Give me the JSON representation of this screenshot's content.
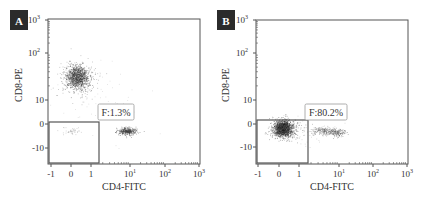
{
  "chart_data": [
    {
      "type": "scatter",
      "panel_label": "A",
      "xlabel": "CD4-FITC",
      "ylabel": "CD8-PE",
      "x_ticks": [
        "-1",
        "0",
        "1",
        "10¹",
        "10²",
        "10³"
      ],
      "y_ticks": [
        "10³",
        "10²",
        "10",
        "0",
        "-10"
      ],
      "gate": {
        "label": "F:1.3%",
        "percent": 1.3,
        "x_range": [
          "-1",
          "~1.5"
        ],
        "y_range": [
          "~-16",
          "~1.5"
        ]
      },
      "populations": [
        {
          "name": "CD8+ cluster",
          "approx_x": "0.3",
          "approx_y": "~30",
          "density": "high"
        },
        {
          "name": "CD4+ cluster",
          "approx_x": "~10",
          "approx_y": "~-3",
          "density": "medium"
        },
        {
          "name": "double-negative (gated)",
          "approx_x": "~0",
          "approx_y": "~-3",
          "density": "sparse"
        }
      ]
    },
    {
      "type": "scatter",
      "panel_label": "B",
      "xlabel": "CD4-FITC",
      "ylabel": "CD8-PE",
      "x_ticks": [
        "-1",
        "0",
        "1",
        "10¹",
        "10²",
        "10³"
      ],
      "y_ticks": [
        "10³",
        "10²",
        "10",
        "0",
        "-10"
      ],
      "gate": {
        "label": "F:80.2%",
        "percent": 80.2,
        "x_range": [
          "-1",
          "~1.5"
        ],
        "y_range": [
          "~-16",
          "~1.5"
        ]
      },
      "populations": [
        {
          "name": "double-negative (gated)",
          "approx_x": "~0.2",
          "approx_y": "~-2",
          "density": "very high"
        },
        {
          "name": "CD4 low tail",
          "approx_x": "~5",
          "approx_y": "~-3",
          "density": "low"
        }
      ]
    }
  ],
  "panels": [
    {
      "id": "A",
      "label": "A",
      "gate_label": "F:1.3%",
      "xlabel": "CD4-FITC",
      "ylabel": "CD8-PE",
      "frame": {
        "x0": 48,
        "y0": 19,
        "x1": 200,
        "y1": 164
      },
      "gate": {
        "x0": 49,
        "y0": 122,
        "x1": 99,
        "y1": 163
      },
      "gate_box": {
        "x": 98,
        "y": 104,
        "w": 36,
        "h": 16
      },
      "letter_box": {
        "x": 10,
        "y": 10,
        "w": 18,
        "h": 20
      },
      "x_ticks": [
        {
          "label": "-1",
          "x": 51,
          "sup": ""
        },
        {
          "label": "0",
          "x": 71,
          "sup": ""
        },
        {
          "label": "1",
          "x": 91,
          "sup": ""
        },
        {
          "label": "10",
          "x": 130,
          "sup": "1"
        },
        {
          "label": "10",
          "x": 165,
          "sup": "2"
        },
        {
          "label": "10",
          "x": 199,
          "sup": "3"
        }
      ],
      "y_ticks": [
        {
          "label": "10",
          "y": 20,
          "sup": "3"
        },
        {
          "label": "10",
          "y": 53,
          "sup": "2"
        },
        {
          "label": "10",
          "y": 100,
          "sup": ""
        },
        {
          "label": "0",
          "y": 124,
          "sup": ""
        },
        {
          "label": "-10",
          "y": 148,
          "sup": ""
        }
      ],
      "ylabel_pos": {
        "x": 22,
        "y": 85
      },
      "xlabel_pos": {
        "x": 124,
        "y": 190
      },
      "clusters": [
        {
          "cx": 77,
          "cy": 77,
          "rx": 9,
          "ry": 9,
          "n": 900,
          "color": "#333333",
          "seed": 11
        },
        {
          "cx": 77,
          "cy": 78,
          "rx": 16,
          "ry": 16,
          "n": 260,
          "color": "#777777",
          "seed": 12
        },
        {
          "cx": 127,
          "cy": 131,
          "rx": 8,
          "ry": 3,
          "n": 360,
          "color": "#444444",
          "seed": 13
        },
        {
          "cx": 71,
          "cy": 131,
          "rx": 8,
          "ry": 3,
          "n": 45,
          "color": "#999999",
          "seed": 14
        },
        {
          "cx": 90,
          "cy": 100,
          "rx": 40,
          "ry": 30,
          "n": 60,
          "color": "#bbbbbb",
          "seed": 15
        }
      ]
    },
    {
      "id": "B",
      "label": "B",
      "gate_label": "F:80.2%",
      "xlabel": "CD4-FITC",
      "ylabel": "CD8-PE",
      "frame": {
        "x0": 256,
        "y0": 20,
        "x1": 408,
        "y1": 164
      },
      "gate": {
        "x0": 257,
        "y0": 120,
        "x1": 308,
        "y1": 163
      },
      "gate_box": {
        "x": 305,
        "y": 104,
        "w": 42,
        "h": 16
      },
      "letter_box": {
        "x": 217,
        "y": 10,
        "w": 18,
        "h": 20
      },
      "x_ticks": [
        {
          "label": "-1",
          "x": 258,
          "sup": ""
        },
        {
          "label": "0",
          "x": 279,
          "sup": ""
        },
        {
          "label": "1",
          "x": 299,
          "sup": ""
        },
        {
          "label": "10",
          "x": 339,
          "sup": "1"
        },
        {
          "label": "10",
          "x": 373,
          "sup": "2"
        },
        {
          "label": "10",
          "x": 407,
          "sup": "3"
        }
      ],
      "y_ticks": [
        {
          "label": "10",
          "y": 20,
          "sup": "3"
        },
        {
          "label": "10",
          "y": 53,
          "sup": "2"
        },
        {
          "label": "10",
          "y": 100,
          "sup": ""
        },
        {
          "label": "0",
          "y": 124,
          "sup": ""
        },
        {
          "label": "-10",
          "y": 147,
          "sup": ""
        }
      ],
      "ylabel_pos": {
        "x": 229,
        "y": 85
      },
      "xlabel_pos": {
        "x": 332,
        "y": 190
      },
      "clusters": [
        {
          "cx": 283,
          "cy": 128,
          "rx": 7,
          "ry": 6,
          "n": 1300,
          "color": "#222222",
          "seed": 21
        },
        {
          "cx": 284,
          "cy": 129,
          "rx": 12,
          "ry": 9,
          "n": 380,
          "color": "#555555",
          "seed": 22
        },
        {
          "cx": 327,
          "cy": 131,
          "rx": 14,
          "ry": 3,
          "n": 260,
          "color": "#666666",
          "seed": 23
        },
        {
          "cx": 338,
          "cy": 133,
          "rx": 6,
          "ry": 3,
          "n": 90,
          "color": "#555555",
          "seed": 24
        },
        {
          "cx": 300,
          "cy": 130,
          "rx": 30,
          "ry": 12,
          "n": 70,
          "color": "#aaaaaa",
          "seed": 25
        }
      ]
    }
  ],
  "colors": {
    "frame": "#555555",
    "letter_box_bg": "#2b2b2b",
    "letter_box_fg": "#ffffff",
    "text": "#333333"
  }
}
